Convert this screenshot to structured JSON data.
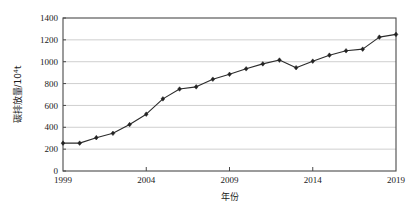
{
  "chart_data": {
    "type": "line",
    "title": "",
    "xlabel": "年份",
    "ylabel": "碳排放量/10⁴t",
    "ylabel_main": "碳排放量/10",
    "ylabel_exponent": "4",
    "ylabel_unit": "t",
    "xlim": [
      1999,
      2019
    ],
    "ylim": [
      0,
      1400
    ],
    "grid": true,
    "legend": false,
    "legend_position": "none",
    "marker": "diamond",
    "line_color": "#2b2b2b",
    "marker_color": "#232323",
    "grid_color": "#c9c9c9",
    "frame_color": "#4a4a4a",
    "x": [
      1999,
      2000,
      2001,
      2002,
      2003,
      2004,
      2005,
      2006,
      2007,
      2008,
      2009,
      2010,
      2011,
      2012,
      2013,
      2014,
      2015,
      2016,
      2017,
      2018,
      2019
    ],
    "values": [
      255,
      255,
      305,
      345,
      425,
      520,
      660,
      750,
      770,
      840,
      885,
      935,
      980,
      1015,
      945,
      1005,
      1060,
      1100,
      1115,
      1225,
      1250
    ],
    "series": [
      {
        "name": "碳排放量",
        "values": [
          255,
          255,
          305,
          345,
          425,
          520,
          660,
          750,
          770,
          840,
          885,
          935,
          980,
          1015,
          945,
          1005,
          1060,
          1100,
          1115,
          1225,
          1250
        ]
      }
    ],
    "categories": [
      "1999",
      "2000",
      "2001",
      "2002",
      "2003",
      "2004",
      "2005",
      "2006",
      "2007",
      "2008",
      "2009",
      "2010",
      "2011",
      "2012",
      "2013",
      "2014",
      "2015",
      "2016",
      "2017",
      "2018",
      "2019"
    ],
    "yticks": [
      0,
      200,
      400,
      600,
      800,
      1000,
      1200,
      1400
    ],
    "ytick_labels": [
      "0",
      "200",
      "400",
      "600",
      "800",
      "1000",
      "1200",
      "1400"
    ],
    "xticks": [
      1999,
      2004,
      2009,
      2014,
      2019
    ],
    "xtick_labels": [
      "1999",
      "2004",
      "2009",
      "2014",
      "2019"
    ]
  },
  "plot_geometry": {
    "left": 63,
    "right": 396,
    "top": 18,
    "bottom": 171
  }
}
